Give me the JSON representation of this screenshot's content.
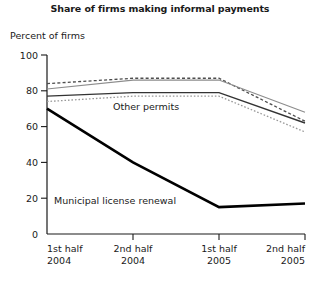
{
  "chart_data": {
    "type": "line",
    "title": "Share of firms making informal payments",
    "ylabel": "Percent of firms",
    "xlabel": "",
    "categories": [
      "1st half 2004",
      "2nd half 2004",
      "1st half 2005",
      "2nd half 2005"
    ],
    "category_lines": [
      [
        "1st half",
        "2004"
      ],
      [
        "2nd half",
        "2004"
      ],
      [
        "1st half",
        "2005"
      ],
      [
        "2nd half",
        "2005"
      ]
    ],
    "ylim": [
      0,
      100
    ],
    "yticks": [
      0,
      20,
      40,
      60,
      80,
      100
    ],
    "grid": false,
    "legend": "none",
    "annotations": [
      {
        "text": "Other permits",
        "x_value": 0.75,
        "y_value": 68
      },
      {
        "text": "Municipal license renewal",
        "x_value": 0.35,
        "y_value": 21
      }
    ],
    "series": [
      {
        "name": "series-upper-dashed",
        "style": "dashed",
        "color": "#4d4d4d",
        "values": [
          84,
          87,
          87,
          63
        ]
      },
      {
        "name": "series-upper-solid-gray",
        "style": "solid-thin",
        "color": "#8c8c8c",
        "values": [
          81,
          86,
          86,
          68
        ]
      },
      {
        "name": "Other permits",
        "style": "solid",
        "color": "#333333",
        "values": [
          77,
          79,
          79,
          62
        ]
      },
      {
        "name": "series-lower-dotted",
        "style": "dotted",
        "color": "#999999",
        "values": [
          74,
          77,
          77,
          57
        ]
      },
      {
        "name": "Municipal license renewal",
        "style": "bold",
        "color": "#000000",
        "values": [
          70,
          40,
          15,
          17
        ]
      }
    ]
  },
  "axis": {
    "ytick_labels": [
      "100",
      "80",
      "60",
      "40",
      "20",
      "0"
    ]
  }
}
